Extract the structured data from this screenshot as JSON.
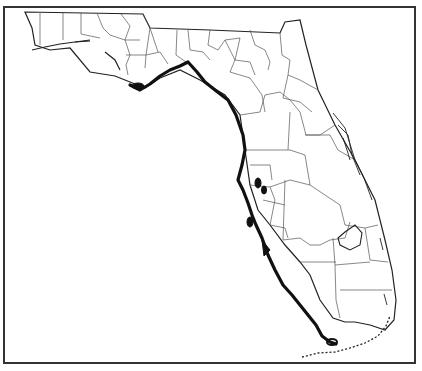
{
  "map": {
    "subject": "Florida county outline map",
    "highlight": "Gulf coast range (thick black line)",
    "colors": {
      "outline": "#222222",
      "county_lines": "#555555",
      "range": "#111111",
      "background": "#ffffff"
    }
  }
}
